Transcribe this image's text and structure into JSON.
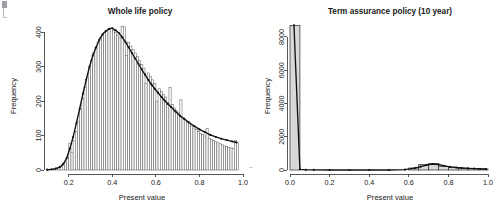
{
  "figure": {
    "panel_count": 2,
    "background": "#ffffff",
    "foreground": "#1a1a1a"
  },
  "chart_data": [
    {
      "type": "bar",
      "panel": "left",
      "title": "Whole life policy",
      "xlabel": "Present value",
      "ylabel": "Frequency",
      "xlim": [
        0.1,
        1.0
      ],
      "ylim": [
        0,
        430
      ],
      "xticks": [
        0.2,
        0.4,
        0.6,
        0.8,
        1.0
      ],
      "xtick_labels": [
        "0.2",
        "0.4",
        "0.6",
        "0.8",
        "1.0"
      ],
      "yticks": [
        0,
        100,
        200,
        300,
        400
      ],
      "ytick_labels": [
        "0",
        "100",
        "200",
        "300",
        "400"
      ],
      "grid": false,
      "legend": "none",
      "bin_width": 0.01,
      "bin_centers": [
        0.105,
        0.115,
        0.125,
        0.135,
        0.145,
        0.155,
        0.165,
        0.175,
        0.185,
        0.195,
        0.205,
        0.215,
        0.225,
        0.235,
        0.245,
        0.255,
        0.265,
        0.275,
        0.285,
        0.295,
        0.305,
        0.315,
        0.325,
        0.335,
        0.345,
        0.355,
        0.365,
        0.375,
        0.385,
        0.395,
        0.405,
        0.415,
        0.425,
        0.435,
        0.445,
        0.455,
        0.465,
        0.475,
        0.485,
        0.495,
        0.505,
        0.515,
        0.525,
        0.535,
        0.545,
        0.555,
        0.565,
        0.575,
        0.585,
        0.595,
        0.605,
        0.615,
        0.625,
        0.635,
        0.645,
        0.655,
        0.665,
        0.675,
        0.685,
        0.695,
        0.705,
        0.715,
        0.725,
        0.735,
        0.745,
        0.755,
        0.765,
        0.775,
        0.785,
        0.795,
        0.805,
        0.815,
        0.825,
        0.835,
        0.845,
        0.855,
        0.865,
        0.875,
        0.885,
        0.895,
        0.905,
        0.915,
        0.925,
        0.935,
        0.945,
        0.955,
        0.965,
        0.975
      ],
      "values": [
        1,
        2,
        2,
        3,
        4,
        6,
        9,
        14,
        22,
        36,
        78,
        52,
        86,
        112,
        142,
        175,
        208,
        240,
        268,
        296,
        318,
        340,
        356,
        372,
        384,
        392,
        400,
        404,
        410,
        412,
        406,
        400,
        392,
        384,
        418,
        416,
        332,
        370,
        360,
        350,
        340,
        330,
        318,
        306,
        296,
        252,
        282,
        272,
        262,
        252,
        200,
        236,
        228,
        220,
        212,
        196,
        240,
        190,
        180,
        172,
        166,
        204,
        152,
        146,
        140,
        134,
        128,
        122,
        117,
        112,
        107,
        103,
        99,
        120,
        92,
        88,
        85,
        82,
        79,
        76,
        73,
        70,
        68,
        66,
        64,
        62,
        86,
        80
      ],
      "overlay": {
        "name": "density-curve",
        "description": "smooth kernel density / fitted frequency curve with point markers overlaid on the histogram",
        "x": [
          0.1,
          0.12,
          0.14,
          0.16,
          0.175,
          0.19,
          0.205,
          0.22,
          0.235,
          0.25,
          0.265,
          0.28,
          0.295,
          0.31,
          0.325,
          0.34,
          0.355,
          0.37,
          0.385,
          0.4,
          0.415,
          0.43,
          0.445,
          0.46,
          0.475,
          0.49,
          0.505,
          0.52,
          0.535,
          0.55,
          0.565,
          0.58,
          0.595,
          0.61,
          0.625,
          0.64,
          0.655,
          0.67,
          0.69,
          0.71,
          0.73,
          0.75,
          0.775,
          0.8,
          0.825,
          0.85,
          0.875,
          0.9,
          0.925,
          0.95,
          0.97
        ],
        "y": [
          1,
          2,
          4,
          9,
          18,
          34,
          62,
          96,
          136,
          178,
          222,
          262,
          300,
          332,
          356,
          378,
          394,
          404,
          410,
          412,
          406,
          398,
          386,
          372,
          356,
          340,
          324,
          308,
          292,
          277,
          262,
          248,
          236,
          224,
          213,
          202,
          192,
          183,
          170,
          158,
          148,
          139,
          128,
          118,
          110,
          102,
          96,
          91,
          87,
          83,
          80
        ]
      }
    },
    {
      "type": "bar",
      "panel": "right",
      "title": "Term assurance policy (10 year)",
      "xlabel": "Present value",
      "ylabel": "Frequency",
      "xlim": [
        0.0,
        1.0
      ],
      "ylim": [
        0,
        8900
      ],
      "xticks": [
        0.0,
        0.2,
        0.4,
        0.6,
        0.8,
        1.0
      ],
      "xtick_labels": [
        "0.0",
        "0.2",
        "0.4",
        "0.6",
        "0.8",
        "1.0"
      ],
      "yticks": [
        0,
        2000,
        4000,
        6000,
        8000
      ],
      "ytick_labels": [
        "0",
        "2000",
        "4000",
        "6000",
        "8000"
      ],
      "grid": false,
      "legend": "none",
      "bin_width": 0.05,
      "bin_centers": [
        0.025,
        0.075,
        0.125,
        0.175,
        0.225,
        0.275,
        0.325,
        0.375,
        0.425,
        0.475,
        0.525,
        0.575,
        0.625,
        0.675,
        0.725,
        0.775,
        0.825,
        0.875,
        0.925,
        0.975
      ],
      "values": [
        8700,
        0,
        0,
        0,
        0,
        0,
        0,
        0,
        0,
        0,
        0,
        0,
        120,
        330,
        380,
        210,
        150,
        110,
        80,
        60
      ],
      "overlay": {
        "name": "density-curve",
        "description": "fitted frequency curve with point markers; spikes at 0 then low tail from 0.6 to 1.0",
        "x": [
          0.02,
          0.05,
          0.08,
          0.12,
          0.2,
          0.3,
          0.4,
          0.5,
          0.58,
          0.63,
          0.66,
          0.69,
          0.72,
          0.75,
          0.78,
          0.81,
          0.84,
          0.87,
          0.9,
          0.93,
          0.96,
          0.99
        ],
        "y": [
          8700,
          40,
          10,
          5,
          2,
          1,
          1,
          2,
          20,
          110,
          200,
          300,
          360,
          330,
          250,
          190,
          150,
          120,
          100,
          85,
          70,
          60
        ]
      }
    }
  ]
}
